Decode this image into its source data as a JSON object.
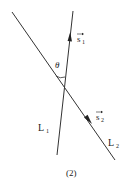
{
  "diagram": {
    "lines": [
      {
        "id": "L1",
        "label": "L",
        "subscript": "1",
        "vector_label": "s",
        "vector_subscript": "1",
        "direction": "up"
      },
      {
        "id": "L2",
        "label": "L",
        "subscript": "2",
        "vector_label": "s",
        "vector_subscript": "2",
        "direction": "down-right"
      }
    ],
    "angle_label": "θ",
    "caption": "(2)",
    "colors": {
      "line": "#333333",
      "text": "#222222",
      "background": "#ffffff"
    }
  }
}
